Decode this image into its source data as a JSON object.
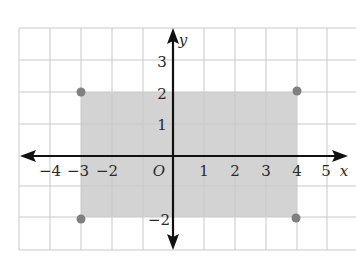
{
  "diagram": {
    "type": "coordinate-plane",
    "axes": {
      "x_label": "x",
      "y_label": "y",
      "origin_label": "O",
      "x_ticks": [
        "−4",
        "−3",
        "−2",
        "1",
        "2",
        "3",
        "4",
        "5"
      ],
      "y_ticks": [
        "3",
        "2",
        "1",
        "−2"
      ]
    },
    "shaded_region": {
      "description": "rectangle -3 <= x <= 4, -2 <= y <= 2",
      "x_range": [
        -3,
        4
      ],
      "y_range": [
        -2,
        2
      ],
      "color": "#d3d3d3"
    },
    "points": [
      {
        "x": -3,
        "y": 2
      },
      {
        "x": 4,
        "y": 2
      },
      {
        "x": -3,
        "y": -2
      },
      {
        "x": 4,
        "y": -2
      }
    ],
    "colors": {
      "grid": "#c9c9c9",
      "axis": "#111111",
      "point": "#808080",
      "shade": "#d3d3d3"
    }
  }
}
